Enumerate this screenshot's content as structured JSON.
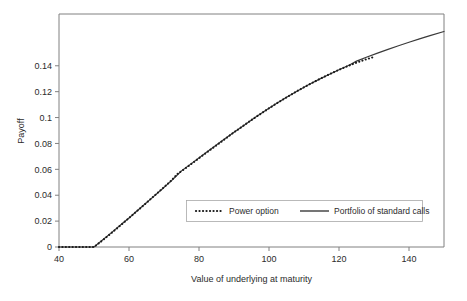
{
  "chart_data": {
    "type": "line",
    "title": "",
    "xlabel": "Value of underlying at maturity",
    "ylabel": "Payoff",
    "xlim": [
      40,
      150
    ],
    "ylim": [
      0,
      0.18
    ],
    "xticks": [
      40,
      60,
      80,
      100,
      120,
      140
    ],
    "yticks": [
      0,
      0.02,
      0.04,
      0.06,
      0.08,
      0.1,
      0.12,
      0.14
    ],
    "xtick_labels": [
      "40",
      "60",
      "80",
      "100",
      "120",
      "140"
    ],
    "ytick_labels": [
      "0",
      "0.02",
      "0.04",
      "0.06",
      "0.08",
      "0.1",
      "0.12",
      "0.14"
    ],
    "grid": false,
    "legend_position": "inside-lower-right",
    "series": [
      {
        "name": "Power option",
        "style": "dotted",
        "color": "#1a1a1a",
        "x": [
          40,
          42,
          44,
          46,
          48,
          50,
          52,
          54,
          56,
          58,
          60,
          62,
          64,
          66,
          68,
          70,
          72,
          74,
          76,
          78,
          80,
          82,
          84,
          86,
          88,
          90,
          92,
          94,
          96,
          98,
          100,
          102,
          104,
          106,
          108,
          110,
          112,
          114,
          116,
          118,
          120,
          122,
          124,
          126,
          128,
          130
        ],
        "y": [
          0,
          0,
          0,
          0,
          0,
          0,
          0.0042,
          0.0086,
          0.0131,
          0.0177,
          0.0224,
          0.0271,
          0.0318,
          0.0366,
          0.0414,
          0.0462,
          0.0511,
          0.0568,
          0.0606,
          0.0646,
          0.0686,
          0.0726,
          0.0766,
          0.0806,
          0.0846,
          0.0886,
          0.0924,
          0.0962,
          0.1,
          0.1036,
          0.1072,
          0.1106,
          0.114,
          0.1172,
          0.1204,
          0.1234,
          0.1263,
          0.1291,
          0.1318,
          0.1344,
          0.1369,
          0.1392,
          0.1414,
          0.1434,
          0.1452,
          0.1468
        ]
      },
      {
        "name": "Portfolio of standard calls",
        "style": "solid",
        "color": "#3a3a3a",
        "x": [
          40,
          45,
          50,
          52,
          55,
          58,
          60,
          63,
          66,
          69,
          72,
          74,
          75,
          78,
          81,
          84,
          87,
          90,
          93,
          96,
          99,
          102,
          105,
          108,
          111,
          114,
          117,
          120,
          123,
          125,
          128,
          131,
          134,
          137,
          140,
          143,
          146,
          150
        ],
        "y": [
          0,
          0,
          0,
          0.0044,
          0.0111,
          0.0179,
          0.0224,
          0.0295,
          0.0366,
          0.0437,
          0.0509,
          0.0562,
          0.0588,
          0.0648,
          0.0708,
          0.0768,
          0.0828,
          0.0886,
          0.0943,
          0.1,
          0.1054,
          0.1106,
          0.1157,
          0.1204,
          0.1249,
          0.1291,
          0.1331,
          0.1369,
          0.1406,
          0.1436,
          0.1468,
          0.1498,
          0.1527,
          0.1555,
          0.1582,
          0.1608,
          0.1633,
          0.1665
        ]
      }
    ],
    "legend": [
      {
        "label": "Power option",
        "style": "dotted"
      },
      {
        "label": "Portfolio of standard calls",
        "style": "solid"
      }
    ]
  },
  "colors": {
    "background": "#ffffff",
    "axis": "#808080",
    "text": "#2b2b2b",
    "solid_series": "#3a3a3a",
    "dotted_series": "#1a1a1a",
    "legend_border": "#a8a8a8"
  }
}
